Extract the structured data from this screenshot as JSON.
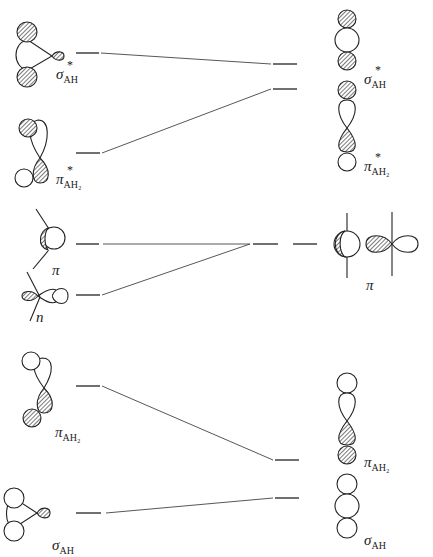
{
  "diagram": {
    "type": "molecular orbital correlation diagram",
    "colors": {
      "line": "#333333",
      "hatch": "#222222",
      "background": "#ffffff"
    },
    "left_column": {
      "levels": [
        {
          "id": "sigma_star_AH",
          "symbol": "σ",
          "superscript": "*",
          "subscript": "AH",
          "y": 53
        },
        {
          "id": "pi_star_AH2",
          "symbol": "π",
          "superscript": "*",
          "subscript": "AH₂",
          "y": 153
        },
        {
          "id": "pi",
          "symbol": "π",
          "superscript": "",
          "subscript": "",
          "y": 244
        },
        {
          "id": "n",
          "symbol": "n",
          "superscript": "",
          "subscript": "",
          "y": 295
        },
        {
          "id": "pi_AH2",
          "symbol": "π",
          "superscript": "",
          "subscript": "AH₂",
          "y": 386
        },
        {
          "id": "sigma_AH",
          "symbol": "σ",
          "superscript": "",
          "subscript": "AH",
          "y": 513
        }
      ]
    },
    "right_column": {
      "levels": [
        {
          "id": "sigma_star_AH",
          "symbol": "σ",
          "superscript": "*",
          "subscript": "AH",
          "y": 64
        },
        {
          "id": "pi_star_AH2",
          "symbol": "π",
          "superscript": "*",
          "subscript": "AH₂",
          "y": 89
        },
        {
          "id": "pi",
          "symbol": "π",
          "superscript": "",
          "subscript": "",
          "y": 244,
          "degenerate": true
        },
        {
          "id": "pi_AH2",
          "symbol": "π",
          "superscript": "",
          "subscript": "AH₂",
          "y": 460
        },
        {
          "id": "sigma_AH",
          "symbol": "σ",
          "superscript": "",
          "subscript": "AH",
          "y": 498
        }
      ]
    },
    "correlations": [
      {
        "from": "sigma_star_AH",
        "to": "sigma_star_AH"
      },
      {
        "from": "pi_star_AH2",
        "to": "pi_star_AH2"
      },
      {
        "from": "pi",
        "to": "pi"
      },
      {
        "from": "n",
        "to": "pi"
      },
      {
        "from": "pi_AH2",
        "to": "pi_AH2"
      },
      {
        "from": "sigma_AH",
        "to": "sigma_AH"
      }
    ]
  },
  "labels": {
    "left_sigma_star": {
      "g": "σ",
      "sup": "*",
      "sub": "AH"
    },
    "left_pi_star": {
      "g": "π",
      "sup": "*",
      "sub": "AH₂"
    },
    "left_pi": {
      "g": "π"
    },
    "left_n": {
      "g": "n"
    },
    "left_pi_ah2": {
      "g": "π",
      "sub": "AH₂"
    },
    "left_sigma": {
      "g": "σ",
      "sub": "AH"
    },
    "right_sigma_star": {
      "g": "σ",
      "sup": "*",
      "sub": "AH"
    },
    "right_pi_star": {
      "g": "π",
      "sup": "*",
      "sub": "AH₂"
    },
    "right_pi": {
      "g": "π"
    },
    "right_pi_ah2": {
      "g": "π",
      "sub": "AH₂"
    },
    "right_sigma": {
      "g": "σ",
      "sub": "AH"
    }
  }
}
